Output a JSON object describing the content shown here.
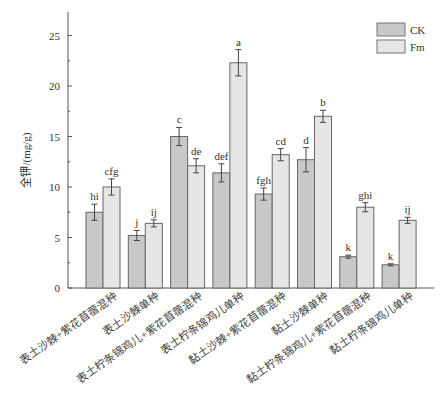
{
  "chart_data": {
    "type": "bar",
    "title": "",
    "xlabel": "",
    "ylabel": "全钾/(mg/g)",
    "ylim": [
      0,
      27.5
    ],
    "yticks": [
      0,
      5,
      10,
      15,
      20,
      25
    ],
    "grid": false,
    "legend_position": "top-right",
    "categories": [
      "表土沙棘+紫花苜蓿混种",
      "表土沙棘单种",
      "表土柠条锦鸡儿+紫花苜蓿混种",
      "表土柠条锦鸡儿单种",
      "黏土沙棘+紫花苜蓿混种",
      "黏土沙棘单种",
      "黏土柠条锦鸡儿+紫花苜蓿混种",
      "黏土柠条锦鸡儿单种"
    ],
    "series": [
      {
        "name": "CK",
        "color": "#c8c8c8",
        "values": [
          7.5,
          5.2,
          15.0,
          11.4,
          9.3,
          12.7,
          3.1,
          2.3
        ],
        "errors": [
          0.8,
          0.5,
          0.9,
          0.9,
          0.6,
          1.2,
          0.15,
          0.1
        ],
        "significance": [
          "hi",
          "j",
          "c",
          "def",
          "fgh",
          "d",
          "k",
          "k"
        ]
      },
      {
        "name": "Fm",
        "color": "#e6e6e6",
        "values": [
          10.0,
          6.4,
          12.1,
          22.3,
          13.2,
          17.0,
          8.0,
          6.7
        ],
        "errors": [
          0.8,
          0.35,
          0.7,
          1.3,
          0.6,
          0.6,
          0.45,
          0.3
        ],
        "significance": [
          "cfg",
          "ij",
          "de",
          "a",
          "cd",
          "b",
          "ghi",
          "ij"
        ]
      }
    ]
  }
}
